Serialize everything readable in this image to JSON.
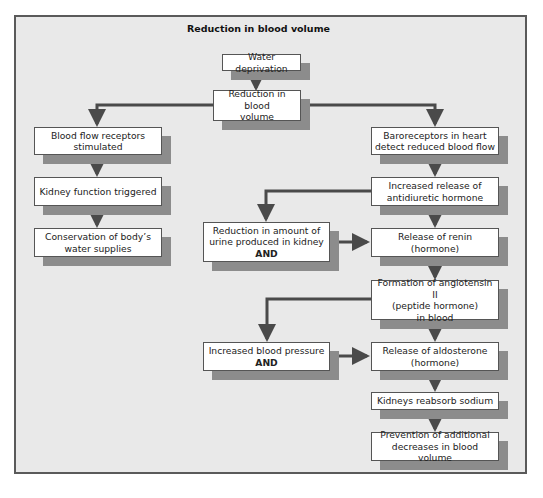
{
  "title": "Reduction in blood volume",
  "colors": {
    "background": "#e9e9e9",
    "frame": "#5a5a5a",
    "box_fill": "#ffffff",
    "box_shadow": "#8c8c8c",
    "arrow": "#4a4a4a"
  },
  "nodes": {
    "water_deprivation": {
      "lines": [
        "Water deprivation"
      ]
    },
    "reduction_blood_volume": {
      "lines": [
        "Reduction in blood",
        "volume"
      ]
    },
    "blood_flow_receptors": {
      "lines": [
        "Blood flow receptors",
        "stimulated"
      ]
    },
    "kidney_function": {
      "lines": [
        "Kidney function triggered"
      ]
    },
    "conservation": {
      "lines": [
        "Conservation of body’s",
        "water supplies"
      ]
    },
    "baroreceptors": {
      "lines": [
        "Baroreceptors in heart",
        "detect reduced blood flow"
      ]
    },
    "adh_release": {
      "lines": [
        "Increased release of",
        "antidiuretic hormone"
      ]
    },
    "urine_reduction": {
      "lines": [
        "Reduction in amount of",
        "urine produced in kidney"
      ],
      "and": "AND"
    },
    "renin_release": {
      "lines": [
        "Release of renin",
        "(hormone)"
      ]
    },
    "angiotensin": {
      "lines": [
        "Formation of angiotensin II",
        "(peptide hormone)",
        "in blood"
      ]
    },
    "blood_pressure": {
      "lines": [
        "Increased blood pressure"
      ],
      "and": "AND"
    },
    "aldosterone": {
      "lines": [
        "Release of aldosterone",
        "(hormone)"
      ]
    },
    "sodium_reabsorb": {
      "lines": [
        "Kidneys reabsorb sodium"
      ]
    },
    "prevention": {
      "lines": [
        "Prevention of additional",
        "decreases in blood volume"
      ]
    }
  },
  "edges": [
    [
      "water_deprivation",
      "reduction_blood_volume"
    ],
    [
      "reduction_blood_volume",
      "blood_flow_receptors"
    ],
    [
      "reduction_blood_volume",
      "baroreceptors"
    ],
    [
      "blood_flow_receptors",
      "kidney_function"
    ],
    [
      "kidney_function",
      "conservation"
    ],
    [
      "baroreceptors",
      "adh_release"
    ],
    [
      "adh_release",
      "urine_reduction"
    ],
    [
      "adh_release",
      "renin_release"
    ],
    [
      "urine_reduction",
      "renin_release"
    ],
    [
      "renin_release",
      "angiotensin"
    ],
    [
      "angiotensin",
      "blood_pressure"
    ],
    [
      "angiotensin",
      "aldosterone"
    ],
    [
      "blood_pressure",
      "aldosterone"
    ],
    [
      "aldosterone",
      "sodium_reabsorb"
    ],
    [
      "sodium_reabsorb",
      "prevention"
    ]
  ]
}
